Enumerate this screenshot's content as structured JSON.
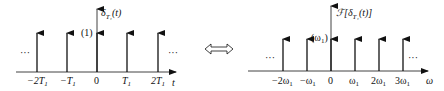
{
  "left_plot": {
    "title": "δ",
    "title_sub": "T₁",
    "title_arg": "(t)",
    "weight_label": "(1)",
    "axis_label": "t",
    "ellipsis": "···",
    "ticks": [
      {
        "label": "−2T",
        "sub": "1",
        "x": 37
      },
      {
        "label": "−T",
        "sub": "1",
        "x": 67
      },
      {
        "label": "0",
        "sub": "",
        "x": 97
      },
      {
        "label": "T",
        "sub": "1",
        "x": 127
      },
      {
        "label": "2T",
        "sub": "1",
        "x": 158
      }
    ]
  },
  "equivalence_symbol": "⟺",
  "right_plot": {
    "title_prefix": "ℱ[",
    "title": "δ",
    "title_sub": "T₁",
    "title_arg": "(t)]",
    "weight_label": "(ω",
    "weight_sub": "1",
    "weight_close": ")",
    "axis_label": "ω",
    "ellipsis": "···",
    "ticks": [
      {
        "label": "−2ω",
        "sub": "1",
        "x": 283
      },
      {
        "label": "−ω",
        "sub": "1",
        "x": 307
      },
      {
        "label": "0",
        "sub": "",
        "x": 331
      },
      {
        "label": "ω",
        "sub": "1",
        "x": 355
      },
      {
        "label": "2ω",
        "sub": "1",
        "x": 379
      },
      {
        "label": "3ω",
        "sub": "1",
        "x": 403
      }
    ]
  },
  "colors": {
    "ink": "#111111",
    "background": "#ffffff"
  }
}
